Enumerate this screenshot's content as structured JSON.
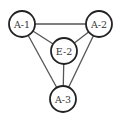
{
  "diagram": {
    "type": "graph",
    "nodes": [
      {
        "id": "A-1",
        "label": "A-1",
        "cx": 22,
        "cy": 24,
        "r": 13
      },
      {
        "id": "A-2",
        "label": "A-2",
        "cx": 99,
        "cy": 24,
        "r": 13
      },
      {
        "id": "E-2",
        "label": "E-2",
        "cx": 64,
        "cy": 51,
        "r": 13
      },
      {
        "id": "A-3",
        "label": "A-3",
        "cx": 63,
        "cy": 99,
        "r": 13
      }
    ],
    "edges": [
      {
        "from": "A-1",
        "to": "A-2"
      },
      {
        "from": "A-1",
        "to": "E-2"
      },
      {
        "from": "A-2",
        "to": "E-2"
      },
      {
        "from": "A-1",
        "to": "A-3"
      },
      {
        "from": "A-2",
        "to": "A-3"
      },
      {
        "from": "E-2",
        "to": "A-3"
      }
    ]
  }
}
